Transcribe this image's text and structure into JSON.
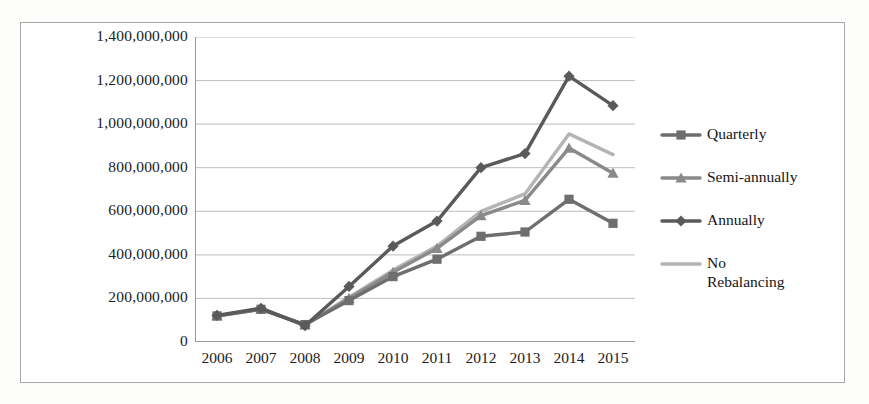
{
  "chart_data": {
    "type": "line",
    "title": "",
    "xlabel": "",
    "ylabel": "",
    "categories": [
      "2006",
      "2007",
      "2008",
      "2009",
      "2010",
      "2011",
      "2012",
      "2013",
      "2014",
      "2015"
    ],
    "ylim": [
      0,
      1400000000
    ],
    "ytick_labels": [
      "1,400,000,000",
      "1,200,000,000",
      "1,000,000,000",
      "800,000,000",
      "600,000,000",
      "400,000,000",
      "200,000,000",
      "0"
    ],
    "ytick_values": [
      1400000000,
      1200000000,
      1000000000,
      800000000,
      600000000,
      400000000,
      200000000,
      0
    ],
    "grid": true,
    "legend_position": "right",
    "series": [
      {
        "name": "Quarterly",
        "marker": "square",
        "color": "#6e6e6e",
        "values": [
          120000000,
          150000000,
          80000000,
          190000000,
          300000000,
          380000000,
          485000000,
          505000000,
          655000000,
          545000000
        ]
      },
      {
        "name": "Semi-annually",
        "marker": "triangle",
        "color": "#8a8a8a",
        "values": [
          120000000,
          152000000,
          78000000,
          200000000,
          320000000,
          430000000,
          580000000,
          650000000,
          890000000,
          775000000
        ]
      },
      {
        "name": "Annually",
        "marker": "diamond",
        "color": "#5a5a5a",
        "values": [
          122000000,
          155000000,
          75000000,
          255000000,
          440000000,
          555000000,
          800000000,
          865000000,
          1220000000,
          1085000000
        ]
      },
      {
        "name": "No\nRebalancing",
        "marker": "none",
        "color": "#b4b4b4",
        "values": [
          118000000,
          150000000,
          80000000,
          205000000,
          330000000,
          440000000,
          600000000,
          680000000,
          955000000,
          860000000
        ]
      }
    ]
  },
  "legend": {
    "items": [
      {
        "label": "Quarterly"
      },
      {
        "label": "Semi-annually"
      },
      {
        "label": "Annually"
      },
      {
        "label": "No\nRebalancing"
      }
    ]
  },
  "colors": {
    "grid": "#bdbdbd",
    "axis": "#9a9a9a",
    "frame": "#a9a9a9",
    "text": "#1c1c1c",
    "quarterly": "#6e6e6e",
    "semi_annually": "#8a8a8a",
    "annually": "#5a5a5a",
    "no_rebalancing": "#b4b4b4"
  }
}
